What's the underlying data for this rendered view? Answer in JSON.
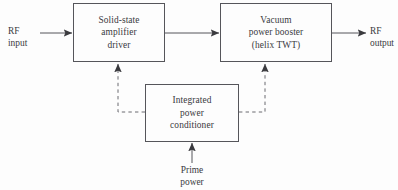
{
  "diagram": {
    "stroke_color": "#55555a",
    "text_color": "#3a3a3e",
    "background": "#fdfdfd",
    "nodes": [
      {
        "id": "amplifier-driver",
        "label": "Solid-state\namplifier\ndriver",
        "lines": [
          "Solid-state",
          "amplifier",
          "driver"
        ]
      },
      {
        "id": "power-booster",
        "label": "Vacuum\npower booster\n(helix TWT)",
        "lines": [
          "Vacuum",
          "power booster",
          "(helix TWT)"
        ]
      },
      {
        "id": "power-conditioner",
        "label": "Integrated\npower\nconditioner",
        "lines": [
          "Integrated",
          "power",
          "conditioner"
        ]
      }
    ],
    "io_labels": [
      {
        "id": "rf-input",
        "label": "RF\ninput",
        "lines": [
          "RF",
          "input"
        ]
      },
      {
        "id": "rf-output",
        "label": "RF\noutput",
        "lines": [
          "RF",
          "output"
        ]
      },
      {
        "id": "prime-power",
        "label": "Prime\npower",
        "lines": [
          "Prime",
          "power"
        ]
      }
    ],
    "connections": [
      {
        "id": "rf-input-to-driver",
        "style": "solid",
        "arrow": true,
        "from": "rf-input",
        "to": "amplifier-driver"
      },
      {
        "id": "driver-to-booster",
        "style": "solid",
        "arrow": true,
        "from": "amplifier-driver",
        "to": "power-booster"
      },
      {
        "id": "booster-to-rf-output",
        "style": "solid",
        "arrow": true,
        "from": "power-booster",
        "to": "rf-output"
      },
      {
        "id": "prime-power-to-conditioner",
        "style": "solid",
        "arrow": true,
        "from": "prime-power",
        "to": "power-conditioner"
      },
      {
        "id": "conditioner-to-driver",
        "style": "dashed",
        "arrow": true,
        "from": "power-conditioner",
        "to": "amplifier-driver"
      },
      {
        "id": "conditioner-to-booster",
        "style": "dashed",
        "arrow": true,
        "from": "power-conditioner",
        "to": "power-booster"
      }
    ]
  }
}
